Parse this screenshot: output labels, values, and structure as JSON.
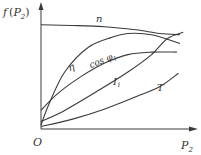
{
  "chart_data": {
    "type": "line",
    "title": "",
    "ylabel": "f(P₂)",
    "xlabel": "P₂",
    "origin_label": "O",
    "x_range": [
      0,
      1
    ],
    "y_range": [
      0,
      1
    ],
    "grid": false,
    "legend": "inline labels on curves",
    "series": [
      {
        "name": "n",
        "label": "n",
        "x": [
          0,
          0.2,
          0.4,
          0.6,
          0.75,
          0.88
        ],
        "y": [
          0.84,
          0.835,
          0.825,
          0.8,
          0.77,
          0.76
        ]
      },
      {
        "name": "eta",
        "label": "η",
        "x": [
          0,
          0.05,
          0.15,
          0.3,
          0.45,
          0.55,
          0.7,
          0.88
        ],
        "y": [
          0.03,
          0.2,
          0.46,
          0.66,
          0.74,
          0.77,
          0.76,
          0.69
        ]
      },
      {
        "name": "cos_phi1",
        "label": "cos φ1",
        "x": [
          0,
          0.1,
          0.25,
          0.4,
          0.55,
          0.7,
          0.86
        ],
        "y": [
          0.15,
          0.28,
          0.42,
          0.53,
          0.6,
          0.62,
          0.62
        ]
      },
      {
        "name": "I1",
        "label": "I1",
        "x": [
          0,
          0.15,
          0.35,
          0.55,
          0.7,
          0.8,
          0.9
        ],
        "y": [
          0.06,
          0.15,
          0.3,
          0.46,
          0.6,
          0.73,
          0.78
        ]
      },
      {
        "name": "T",
        "label": "T",
        "x": [
          0,
          0.2,
          0.4,
          0.6,
          0.75,
          0.87
        ],
        "y": [
          0.02,
          0.08,
          0.16,
          0.26,
          0.34,
          0.45
        ]
      }
    ]
  }
}
